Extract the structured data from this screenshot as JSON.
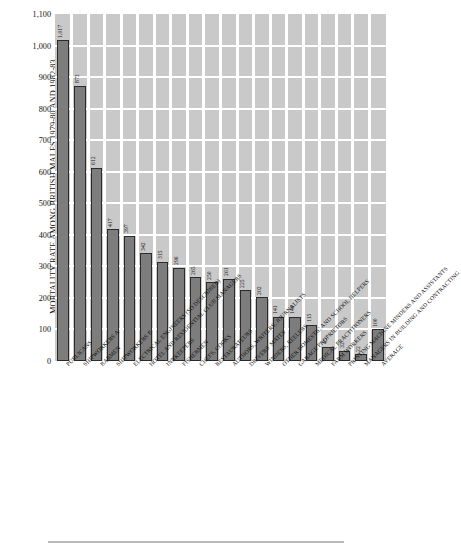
{
  "chart_data": {
    "type": "bar",
    "title": "",
    "xlabel": "",
    "ylabel": "MORTALITY RATE AMONG BRITISH MALES 1979-80 AND 1982-83",
    "ylim": [
      0,
      1100
    ],
    "ytick_step": 100,
    "grid": "horizontal white gridlines on grey plot background",
    "legend": "none",
    "bar_color": "#7d7d7d",
    "plot_background": "#c9c9c9",
    "gridline_color": "#ffffff",
    "categories": [
      "PUBLICANS",
      "SHIPWORKERS A",
      "BARMEN",
      "SHIPWORKERS B",
      "ELECTRICAL ENGINEERS (SO DESCRIBED)",
      "HOTEL AND RESIDENTIAL CLUB MANAGERS",
      "INNKEEPERS",
      "FISHERMEN",
      "CHEFS, COOKS",
      "RESTAURATEURS",
      "AUTHORS, WRITERS, JOURNALISTS",
      "DRIVERS' MATES",
      "WINDERS, REELERS",
      "OTHER DOMESTIC AND SCHOOL HELPERS",
      "GARAGE PROPRIETORS",
      "MEDICAL PRACTITIONERS",
      "FARM WORKERS",
      "PRINTING MACHINE MINDERS AND ASSISTANTS",
      "MANAGERS IN BUILDING AND CONTRACTING",
      "AVERAGE"
    ],
    "values": [
      1017,
      873,
      612,
      417,
      397,
      342,
      315,
      296,
      265,
      250,
      261,
      225,
      202,
      141,
      140,
      115,
      45,
      32,
      22,
      100
    ],
    "value_labels": [
      "1,017",
      "873",
      "612",
      "417",
      "397",
      "342",
      "315",
      "296",
      "265",
      "250",
      "261",
      "225",
      "202",
      "141",
      "140",
      "115",
      "45",
      "32",
      "22",
      "100"
    ],
    "ytick_labels": [
      "0",
      "100",
      "200",
      "300",
      "400",
      "500",
      "600",
      "700",
      "800",
      "900",
      "1,000",
      "1,100"
    ]
  },
  "caption": ""
}
